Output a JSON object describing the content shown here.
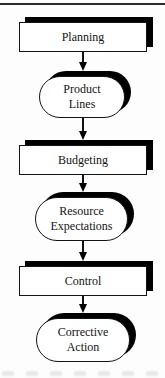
{
  "figure": {
    "type": "flowchart",
    "colors": {
      "background": "#fdfdfd",
      "node_fill": "#ffffff",
      "node_border": "#141414",
      "shadow": "#000000",
      "top_rule": "#2b2b2b"
    },
    "nodes": [
      {
        "id": "planning",
        "shape": "rectangle",
        "line1": "Planning"
      },
      {
        "id": "product-lines",
        "shape": "stadium",
        "line1": "Product",
        "line2": "Lines"
      },
      {
        "id": "budgeting",
        "shape": "rectangle",
        "line1": "Budgeting"
      },
      {
        "id": "resource-expectations",
        "shape": "stadium",
        "line1": "Resource",
        "line2": "Expectations"
      },
      {
        "id": "control",
        "shape": "rectangle",
        "line1": "Control"
      },
      {
        "id": "corrective-action",
        "shape": "stadium",
        "line1": "Corrective",
        "line2": "Action"
      }
    ],
    "connectors": [
      {
        "from": "Planning",
        "to": "Product Lines",
        "direction": "down"
      },
      {
        "from": "Product Lines",
        "to": "Budgeting",
        "direction": "down"
      },
      {
        "from": "Budgeting",
        "to": "Resource Expectations",
        "direction": "down"
      },
      {
        "from": "Resource Expectations",
        "to": "Control",
        "direction": "down"
      },
      {
        "from": "Control",
        "to": "Corrective Action",
        "direction": "down"
      }
    ]
  }
}
